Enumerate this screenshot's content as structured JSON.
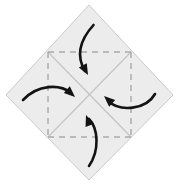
{
  "canvas": {
    "width": 178,
    "height": 191,
    "background": "#ffffff",
    "title": "Origami square base pinwheel fold step"
  },
  "figure": {
    "type": "origami-fold-diagram",
    "shape_name": "square-rotated-45-diamond",
    "paper": {
      "fill": "#ececed",
      "stroke": "#c9cacb",
      "stroke_width": 1,
      "vertices": [
        {
          "label": "top",
          "x": 89,
          "y": 5
        },
        {
          "label": "right",
          "x": 173,
          "y": 95
        },
        {
          "label": "bottom",
          "x": 89,
          "y": 180
        },
        {
          "label": "left",
          "x": 6,
          "y": 95
        }
      ]
    },
    "crease_lines": {
      "dashed": {
        "color": "#a7a9ab",
        "stroke_width": 1.4,
        "dash_pattern": "6 5",
        "segments": [
          {
            "name": "crease-top-horizontal",
            "x1": 48,
            "y1": 52,
            "x2": 131,
            "y2": 52
          },
          {
            "name": "crease-bottom-horizontal",
            "x1": 48,
            "y1": 137,
            "x2": 131,
            "y2": 137
          },
          {
            "name": "crease-left-vertical",
            "x1": 48,
            "y1": 52,
            "x2": 48,
            "y2": 137
          },
          {
            "name": "crease-right-vertical",
            "x1": 131,
            "y1": 52,
            "x2": 131,
            "y2": 137
          }
        ]
      },
      "solid": {
        "color": "#c3c4c6",
        "stroke_width": 1.2,
        "segments": [
          {
            "name": "diagonal-nw-se",
            "x1": 48,
            "y1": 52,
            "x2": 131,
            "y2": 137
          },
          {
            "name": "diagonal-ne-sw",
            "x1": 131,
            "y1": 52,
            "x2": 48,
            "y2": 137
          }
        ]
      }
    },
    "arrows": {
      "color": "#131313",
      "stroke_width": 2.6,
      "head_length": 11,
      "head_width": 9,
      "items": [
        {
          "name": "fold-arrow-top",
          "label": "top corner folds down to center",
          "direction": "down-right",
          "path": "M 93.5 25 C 80 40, 76 56, 85 71",
          "tip": {
            "x": 88,
            "y": 75
          },
          "tip_angle_deg": 62
        },
        {
          "name": "fold-arrow-left",
          "label": "left corner folds right to center",
          "direction": "right-down",
          "path": "M 23 100 C 38 84, 60 84, 71 93",
          "tip": {
            "x": 75,
            "y": 97
          },
          "tip_angle_deg": 42
        },
        {
          "name": "fold-arrow-right",
          "label": "right corner folds left to center",
          "direction": "left-up",
          "path": "M 155 94 C 146 110, 120 112, 108 101",
          "tip": {
            "x": 104,
            "y": 96
          },
          "tip_angle_deg": 222
        },
        {
          "name": "fold-arrow-bottom",
          "label": "bottom corner folds up to center",
          "direction": "up-left",
          "path": "M 89 166 C 100 150, 98 128, 89 119",
          "tip": {
            "x": 86,
            "y": 115
          },
          "tip_angle_deg": 250
        }
      ]
    }
  }
}
